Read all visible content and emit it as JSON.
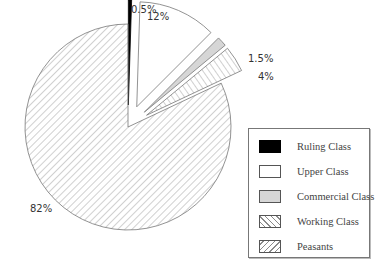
{
  "chart_data": {
    "type": "pie",
    "title": "",
    "exploded": true,
    "categories": [
      "Ruling Class",
      "Upper Class",
      "Commercial Class",
      "Working Class",
      "Peasants"
    ],
    "values": [
      0.5,
      12,
      1.5,
      4,
      82
    ],
    "labels": [
      "0.5%",
      "12%",
      "1.5%",
      "4%",
      "82%"
    ],
    "fills": [
      "solid-black",
      "white",
      "light-gray",
      "vertical-hatch",
      "diagonal-hatch"
    ],
    "colors": {
      "ruling": "#000000",
      "upper": "#ffffff",
      "commercial": "#d6d6d6",
      "working": "#ffffff",
      "peasants": "#ffffff",
      "stroke": "#777777"
    },
    "legend_position": "right"
  },
  "legend": {
    "items": [
      {
        "label": "Ruling Class"
      },
      {
        "label": "Upper Class"
      },
      {
        "label": "Commercial Class"
      },
      {
        "label": "Working Class"
      },
      {
        "label": "Peasants"
      }
    ]
  }
}
